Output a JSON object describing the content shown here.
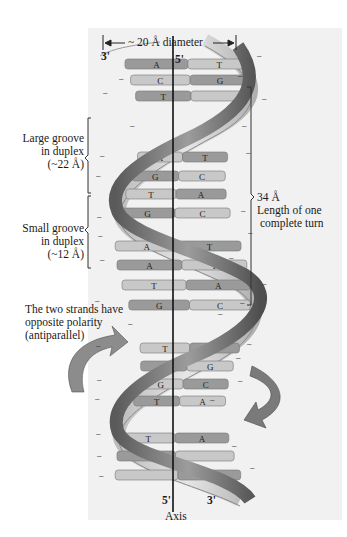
{
  "figure": {
    "diameter_label": "~ 20 Å diameter",
    "strand_ends": {
      "top_left": "3'",
      "top_right": "5'",
      "bottom_left": "5'",
      "bottom_right": "3'"
    },
    "axis_label": "Axis",
    "large_groove": {
      "line1": "Large groove",
      "line2": "in duplex",
      "line3": "(~22 Å)"
    },
    "small_groove": {
      "line1": "Small groove",
      "line2": "in duplex",
      "line3": "(~12 Å)"
    },
    "turn_length": {
      "line1": "34 Å",
      "line2": "Length of one",
      "line3": "complete turn"
    },
    "polarity_note": {
      "line1": "The two strands have",
      "line2": "opposite polarity",
      "line3": "(antiparallel)"
    },
    "base_pairs": [
      {
        "left": "A",
        "right": "T",
        "y": 64
      },
      {
        "left": "C",
        "right": "G",
        "y": 80
      },
      {
        "left": "T",
        "right": "",
        "y": 96
      },
      {
        "left": "A",
        "right": "T",
        "y": 157
      },
      {
        "left": "G",
        "right": "C",
        "y": 176
      },
      {
        "left": "T",
        "right": "A",
        "y": 194
      },
      {
        "left": "G",
        "right": "C",
        "y": 213
      },
      {
        "left": "A",
        "right": "T",
        "y": 246
      },
      {
        "left": "A",
        "right": "T",
        "y": 265
      },
      {
        "left": "T",
        "right": "A",
        "y": 285
      },
      {
        "left": "G",
        "right": "C",
        "y": 305
      },
      {
        "left": "T",
        "right": "A",
        "y": 348
      },
      {
        "left": "C",
        "right": "G",
        "y": 366
      },
      {
        "left": "G",
        "right": "C",
        "y": 384
      },
      {
        "left": "T",
        "right": "A",
        "y": 401
      },
      {
        "left": "T",
        "right": "A",
        "y": 438
      },
      {
        "left": "",
        "right": "",
        "y": 456
      },
      {
        "left": "",
        "right": "",
        "y": 475
      }
    ],
    "colors": {
      "panel_bg": "#f1f1f1",
      "strand_dark": "#6e6e6e",
      "strand_light": "#cfcfcf",
      "base_dark": "#9a9a9a",
      "base_light": "#c8c8c8",
      "axis_line": "#111111"
    }
  }
}
